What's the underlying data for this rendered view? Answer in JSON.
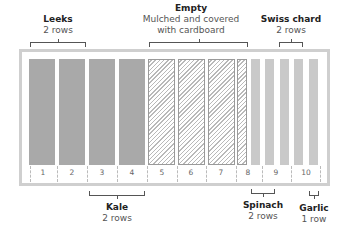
{
  "diagram": {
    "type": "garden-bed-layout",
    "top_labels": [
      {
        "title": "Leeks",
        "sub": "2 rows"
      },
      {
        "title": "Empty",
        "sub1": "Mulched and covered",
        "sub2": "with cardboard"
      },
      {
        "title": "Swiss chard",
        "sub": "2 rows"
      }
    ],
    "bottom_labels": [
      {
        "title": "Kale",
        "sub": "2 rows"
      },
      {
        "title": "Spinach",
        "sub": "2 rows"
      },
      {
        "title": "Garlic",
        "sub": "1 row"
      }
    ],
    "sections": [
      "1",
      "2",
      "3",
      "4",
      "5",
      "6",
      "7",
      "8",
      "9",
      "10"
    ],
    "colors": {
      "planted_wide": "#a9a9a9",
      "planted_narrow": "#c9c9c9",
      "frame": "#cfcfcf",
      "bracket": "#555555"
    }
  }
}
